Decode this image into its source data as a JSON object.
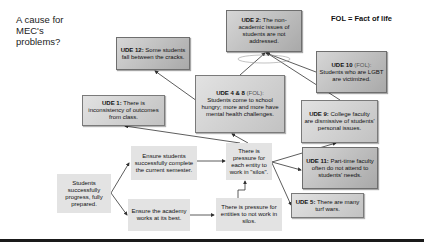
{
  "title": "A cause for MEC's problems?",
  "legend": "FOL = Fact of life",
  "colors": {
    "ude_box": "#b8b8b8",
    "plain_box": "#e3e3e3",
    "arrow": "#333333",
    "rule": "#1a1a1a"
  },
  "nodes": {
    "ude12": {
      "label": "UDE 12:",
      "text": "Some students fall between the cracks."
    },
    "ude1": {
      "label": "UDE 1:",
      "text": "There is inconsistency of outcomes from class."
    },
    "ude48": {
      "label": "UDE 4 & 8",
      "tag": "(FOL):",
      "text": "Students come to school hungry; more and more have mental health challenges."
    },
    "ude2": {
      "label": "UDE 2:",
      "text": "The non-academic issues of students are not addressed."
    },
    "ude10": {
      "label": "UDE 10",
      "tag": "(FOL):",
      "text": "Students who are LGBT are victimized."
    },
    "ude9": {
      "label": "UDE 9:",
      "text": "College faculty are dismissive of students' personal issues."
    },
    "ude11": {
      "label": "UDE 11:",
      "text": "Part-time faculty often do not attend to students' needs."
    },
    "ude5": {
      "label": "UDE 5:",
      "text": "There are many turf wars."
    },
    "silo_pressure": {
      "text": "There is pressure for each entity to work in \"silos\"."
    },
    "not_silo_pressure": {
      "text": "There is pressure for entities to not work in silos."
    },
    "ensure_semester": {
      "text": "Ensure students successfully complete the current semester."
    },
    "ensure_academy": {
      "text": "Ensure the academy works at its best."
    },
    "goal": {
      "text": "Students successfully progress, fully prepared."
    }
  },
  "edges": [
    {
      "from": "goal",
      "to": "ensure_semester"
    },
    {
      "from": "goal",
      "to": "ensure_academy"
    },
    {
      "from": "ensure_semester",
      "to": "silo_pressure"
    },
    {
      "from": "ensure_academy",
      "to": "not_silo_pressure"
    },
    {
      "from": "not_silo_pressure",
      "to": "silo_pressure"
    },
    {
      "from": "silo_pressure",
      "to": "ude1"
    },
    {
      "from": "silo_pressure",
      "to": "ude48"
    },
    {
      "from": "silo_pressure",
      "to": "ude9"
    },
    {
      "from": "silo_pressure",
      "to": "ude11"
    },
    {
      "from": "silo_pressure",
      "to": "ude5"
    },
    {
      "from": "ude48",
      "to": "ude12"
    },
    {
      "from": "ude48",
      "to": "ude2"
    },
    {
      "from": "ude10",
      "to": "ude2"
    },
    {
      "from": "ude9",
      "to": "ude2"
    }
  ]
}
